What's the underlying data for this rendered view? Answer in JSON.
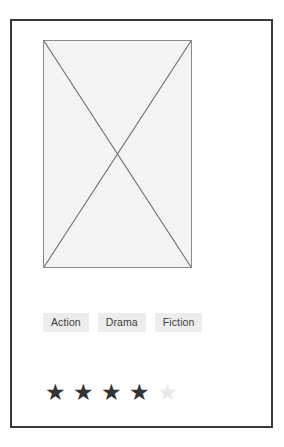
{
  "card": {
    "name": "media-card",
    "background": "#ffffff",
    "border_color": "#3a3a3a"
  },
  "media": {
    "type": "image-placeholder",
    "icon": "image-placeholder-cross-icon",
    "fill": "#f4f4f4",
    "stroke": "#8a8a8a"
  },
  "tags": {
    "items": [
      {
        "label": "Action"
      },
      {
        "label": "Drama"
      },
      {
        "label": "Fiction"
      }
    ],
    "chip_background": "#ededed",
    "chip_text_color": "#3c3c3c"
  },
  "rating": {
    "value": 4,
    "max": 5,
    "filled_glyph": "★",
    "empty_glyph": "★",
    "filled_color": "#333333",
    "empty_color": "#e9e9e9",
    "stars": [
      {
        "state": "filled",
        "glyph": "★"
      },
      {
        "state": "filled",
        "glyph": "★"
      },
      {
        "state": "filled",
        "glyph": "★"
      },
      {
        "state": "filled",
        "glyph": "★"
      },
      {
        "state": "empty",
        "glyph": "★"
      }
    ]
  }
}
